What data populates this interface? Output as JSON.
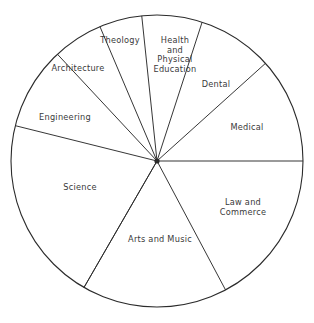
{
  "chart_data": {
    "type": "pie",
    "title": "",
    "subtitle": "",
    "xlabel": "",
    "ylabel": "",
    "legend": "none",
    "grid": false,
    "value_unit": "degrees",
    "note": "Slice sizes read off the drawn sector angles; labels are placed inside each sector.",
    "categories": [
      "Health and Physical Education",
      "Dental",
      "Medical",
      "Law and Commerce",
      "Arts and Music",
      "Science",
      "Engineering",
      "Architecture",
      "Theology"
    ],
    "values": [
      24,
      30,
      42,
      62,
      58,
      72,
      33,
      20,
      17
    ],
    "slices": [
      {
        "label": "Health\nand\nPhysical\nEducation",
        "label_plain": "Health and Physical Education",
        "start_angle": 72,
        "end_angle": 96,
        "sweep": 24,
        "label_x": 175,
        "label_y": 55
      },
      {
        "label": "Dental",
        "label_plain": "Dental",
        "start_angle": 42,
        "end_angle": 72,
        "sweep": 30,
        "label_x": 216,
        "label_y": 85
      },
      {
        "label": "Medical",
        "label_plain": "Medical",
        "start_angle": 0,
        "end_angle": 42,
        "sweep": 42,
        "label_x": 247,
        "label_y": 128
      },
      {
        "label": "Law and Commerce",
        "label_plain": "Law and Commerce",
        "start_angle": -62,
        "end_angle": 0,
        "sweep": 62,
        "label_x": 243,
        "label_y": 208
      },
      {
        "label": "Arts and Music",
        "label_plain": "Arts and Music",
        "start_angle": -120,
        "end_angle": -62,
        "sweep": 58,
        "label_x": 160,
        "label_y": 240
      },
      {
        "label": "Science",
        "label_plain": "Science",
        "start_angle": 166,
        "end_angle": 240,
        "sweep": 74,
        "label_x": 80,
        "label_y": 188
      },
      {
        "label": "Engineering",
        "label_plain": "Engineering",
        "start_angle": 133,
        "end_angle": 166,
        "sweep": 33,
        "label_x": 65,
        "label_y": 118
      },
      {
        "label": "Architecture",
        "label_plain": "Architecture",
        "start_angle": 113,
        "end_angle": 133,
        "sweep": 20,
        "label_x": 78,
        "label_y": 69
      },
      {
        "label": "Theology",
        "label_plain": "Theology",
        "start_angle": 96,
        "end_angle": 113,
        "sweep": 17,
        "label_x": 120,
        "label_y": 41
      }
    ],
    "geometry": {
      "center_x": 157,
      "center_y": 161,
      "radius": 146
    },
    "colors": {
      "outline": "#2b2b2b",
      "fill": "#ffffff",
      "label_text": "#3a3a3a",
      "background": "#ffffff"
    }
  }
}
